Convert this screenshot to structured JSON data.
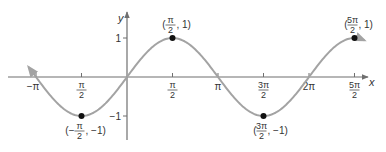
{
  "chart_data": {
    "type": "line",
    "title": "",
    "function": "y = sin x",
    "xlabel": "x",
    "ylabel": "y",
    "xlim": [
      -3.3,
      8.3
    ],
    "ylim": [
      -1.3,
      1.3
    ],
    "grid": false,
    "legend": null,
    "x_ticks": [
      {
        "value": -3.14159,
        "label": "−π"
      },
      {
        "value": -1.5708,
        "label_num": "π",
        "label_den": "2",
        "note": "rendered without minus sign"
      },
      {
        "value": 1.5708,
        "label_num": "π",
        "label_den": "2"
      },
      {
        "value": 3.14159,
        "label": "π"
      },
      {
        "value": 4.71239,
        "label_num": "3π",
        "label_den": "2"
      },
      {
        "value": 6.28319,
        "label": "2π"
      },
      {
        "value": 7.85398,
        "label_num": "5π",
        "label_den": "2"
      }
    ],
    "y_ticks": [
      {
        "value": 1,
        "label": "1"
      },
      {
        "value": -1,
        "label": "−1"
      }
    ],
    "series": [
      {
        "name": "sin x",
        "x_range": [
          -3.4,
          8.2
        ],
        "color": "#a3a3a3",
        "arrows_both_ends": true
      }
    ],
    "points": [
      {
        "x": -1.5708,
        "y": -1,
        "label_num": "π",
        "label_den": "2",
        "label_prefix": "(−",
        "label_suffix": ", −1)"
      },
      {
        "x": 1.5708,
        "y": 1,
        "label_num": "π",
        "label_den": "2",
        "label_prefix": "(",
        "label_suffix": ", 1)"
      },
      {
        "x": 4.71239,
        "y": -1,
        "label_num": "3π",
        "label_den": "2",
        "label_prefix": "(",
        "label_suffix": ", −1)"
      },
      {
        "x": 7.85398,
        "y": 1,
        "label_num": "5π",
        "label_den": "2",
        "label_prefix": "(",
        "label_suffix": ", 1)"
      }
    ]
  },
  "layout": {
    "origin_px": [
      127,
      77
    ],
    "px_per_half_pi": 45.5,
    "px_per_unit_y": 39,
    "axis_color": "#6f6f6f",
    "curve_color": "#a3a3a3",
    "point_color": "#111111"
  }
}
